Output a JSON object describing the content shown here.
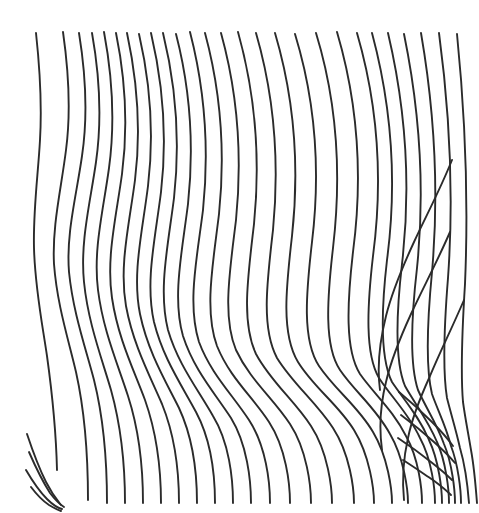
{
  "artwork": {
    "title": "Wavy parallel line field",
    "description": "Hand-drawn style field of near-parallel sinuous contour lines with two fan-shaped dislocation zones",
    "type": "line-drawing",
    "canvas": {
      "width": 479,
      "height": 513,
      "background": "#ffffff"
    },
    "stroke": {
      "color": "#2b2b2b",
      "width": 1.9,
      "cap": "round"
    },
    "line_count": 34,
    "notes": {
      "dislocation_left_bottom": "fan of short line terminations near x=25-130, y=430-505",
      "dislocation_center": "pinch / convergence of lines near x=300, y=280",
      "dislocation_right_bottom": "fan of short line terminations near x=400-465, y=390-500",
      "right_mid_starts": "two lines begin mid-canvas near x=452,y=160 and x=450,y=232"
    },
    "paths": [
      "M 36,33 C 40,70 42,106 40,140 C 38,176 33,210 34,248 C 35,288 42,322 47,356 C 52,392 56,428 57,470",
      "M 63,32 C 69,74 71,112 66,150 C 61,190 52,226 54,264 C 57,304 68,338 76,372 C 84,408 88,448 88,500",
      "M 79,33 C 86,76 88,116 82,156 C 76,198 66,234 69,272 C 73,312 85,346 94,380 C 103,416 107,456 107,503",
      "M 92,33 C 100,78 102,120 96,162 C 90,204 80,242 84,282 C 88,322 101,356 111,390 C 121,426 125,464 125,503",
      "M 104,32 C 113,80 115,124 109,168 C 103,212 93,250 98,290 C 103,330 117,362 128,396 C 139,430 143,468 143,503",
      "M 116,33 C 126,82 128,128 122,174 C 116,218 106,258 112,298 C 118,338 133,368 145,400 C 157,434 161,470 161,503",
      "M 127,33 C 138,84 141,132 135,180 C 129,226 119,266 126,306 C 133,344 149,374 162,404 C 175,436 179,472 179,503",
      "M 139,34 C 151,86 154,136 148,186 C 142,234 132,274 140,314 C 148,352 165,380 179,408 C 193,438 197,474 197,503",
      "M 151,33 C 164,88 167,140 161,192 C 155,240 145,282 154,322 C 163,358 181,384 196,412 C 211,440 215,476 215,503",
      "M 163,33 C 177,90 180,144 174,198 C 168,246 158,290 168,330 C 178,364 197,388 213,416 C 229,442 233,478 233,503",
      "M 176,34 C 191,92 194,148 188,204 C 182,252 172,298 183,336 C 194,370 214,392 231,418 C 247,444 251,480 251,503",
      "M 190,32 C 206,94 209,152 203,210 C 197,258 187,304 199,342 C 211,374 232,394 249,420 C 266,446 270,482 270,503",
      "M 205,33 C 222,96 225,156 219,214 C 213,264 204,310 217,346 C 230,378 252,396 269,422 C 286,448 290,484 290,503",
      "M 221,33 C 239,98 242,160 236,220 C 230,270 222,316 236,350 C 250,380 273,398 290,424 C 307,450 311,486 311,503",
      "M 238,32 C 257,100 260,164 254,224 C 248,276 241,322 256,354 C 271,382 294,400 311,426 C 328,452 332,488 332,503",
      "M 256,33 C 276,102 279,168 273,230 C 267,282 261,328 277,358 C 293,384 316,402 333,428 C 350,454 354,489 354,503",
      "M 275,33 C 296,104 299,172 292,236 C 286,288 281,334 298,362 C 314,388 338,404 354,430 C 370,456 374,490 374,503",
      "M 295,34 C 317,106 320,176 312,242 C 306,294 302,340 319,366 C 335,390 358,406 373,432 C 388,457 392,490 392,503",
      "M 316,33 C 339,108 341,180 333,248 C 327,300 324,346 340,370 C 355,392 376,408 390,434 C 404,458 408,490 408,503",
      "M 337,32 C 360,110 362,184 353,252 C 347,304 345,350 360,374 C 374,394 393,410 406,436 C 419,459 422,490 422,503",
      "M 357,33 C 380,112 382,188 373,256 C 367,308 365,354 379,378 C 392,398 409,414 420,438 C 432,460 435,490 435,503",
      "M 372,33 C 394,115 396,192 387,260 C 381,312 380,358 392,382 C 404,400 419,416 429,440 C 439,461 442,490 442,503",
      "M 388,33 C 408,118 410,196 402,264 C 396,316 395,362 405,386 C 415,404 428,420 437,442 C 446,462 449,490 449,503",
      "M 404,34 C 422,122 424,200 417,268 C 411,320 410,366 418,390 C 426,408 437,424 444,444 C 452,463 455,490 455,503",
      "M 421,33 C 437,126 438,204 432,272 C 427,324 426,370 432,394 C 438,411 446,426 451,446 C 458,464 461,490 461,503",
      "M 439,33 C 452,130 453,208 448,278 C 444,328 443,374 447,398 C 451,414 456,430 460,448 C 465,465 468,490 469,503",
      "M 457,34 C 467,134 468,214 465,284 C 462,332 461,378 463,402 C 465,417 468,432 471,450 C 474,466 476,490 477,503",
      "M 452,160 C 440,190 426,216 414,242 C 402,268 392,292 386,316 C 379,344 377,368 380,390",
      "M 450,232 C 437,262 423,288 411,314 C 400,338 391,360 386,382 C 380,406 379,428 382,450",
      "M 464,300 C 452,328 440,352 430,376 C 420,398 412,418 408,438 C 403,460 402,480 404,500",
      "M 27,434 C 33,452 39,468 46,482 C 52,494 57,500 61,505",
      "M 29,452 C 36,468 43,482 50,493 C 56,501 61,505 64,507",
      "M 26,470 C 33,482 40,492 47,499 C 53,505 58,508 62,509",
      "M 31,487 C 37,495 43,501 49,505 C 54,508 58,510 61,511",
      "M 399,392 C 411,402 422,412 432,422 C 441,431 448,439 453,446",
      "M 401,415 C 413,424 424,433 434,442 C 443,450 450,457 455,463",
      "M 398,438 C 410,446 421,454 431,462 C 440,469 447,475 452,480",
      "M 403,460 C 414,467 424,474 433,480 C 441,486 447,491 451,495"
    ]
  }
}
